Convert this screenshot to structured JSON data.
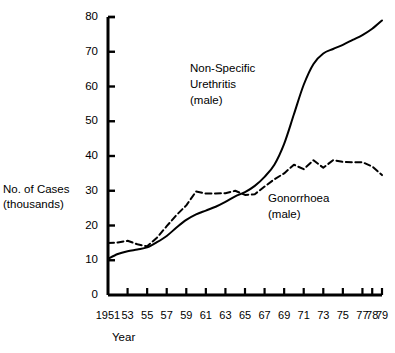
{
  "chart_data": {
    "type": "line",
    "title": "",
    "subtitle": "",
    "xlabel": "Year",
    "ylabel": "No. of Cases\n(thousands)",
    "ylabel_line1": "No. of Cases",
    "ylabel_line2": "(thousands)",
    "xlim": [
      1951,
      1979
    ],
    "ylim": [
      0,
      80
    ],
    "grid": false,
    "legend_position": "inline-annotations",
    "y_ticks": [
      0,
      10,
      20,
      30,
      40,
      50,
      60,
      70,
      80
    ],
    "y_tick_labels": [
      "0",
      "10",
      "20",
      "30",
      "40",
      "50",
      "60",
      "70",
      "80"
    ],
    "x_ticks": [
      1951,
      1953,
      1955,
      1957,
      1959,
      1961,
      1963,
      1965,
      1967,
      1969,
      1971,
      1973,
      1975,
      1977,
      1978,
      1979
    ],
    "x_tick_labels": [
      "1951",
      "53",
      "55",
      "57",
      "59",
      "61",
      "63",
      "65",
      "67",
      "69",
      "71",
      "73",
      "75",
      "77",
      "78",
      "79"
    ],
    "series": [
      {
        "name": "Non-Specific Urethritis (male)",
        "label_line1": "Non-Specific",
        "label_line2": "Urethritis",
        "label_line3": "(male)",
        "style": "solid",
        "color": "#000000",
        "x": [
          1951,
          1952,
          1953,
          1954,
          1955,
          1956,
          1957,
          1958,
          1959,
          1960,
          1961,
          1962,
          1963,
          1964,
          1965,
          1966,
          1967,
          1968,
          1969,
          1970,
          1971,
          1972,
          1973,
          1974,
          1975,
          1976,
          1977,
          1978,
          1979
        ],
        "values": [
          10.4,
          11.8,
          12.6,
          13.1,
          13.7,
          15.2,
          17.0,
          19.4,
          21.6,
          23.2,
          24.3,
          25.4,
          26.8,
          28.4,
          29.6,
          31.4,
          34.0,
          37.5,
          43.5,
          52.0,
          60.5,
          66.5,
          69.5,
          70.8,
          72.0,
          73.4,
          74.8,
          76.6,
          79.0
        ]
      },
      {
        "name": "Gonorrhoea (male)",
        "label_line1": "Gonorrhoea",
        "label_line2": "(male)",
        "style": "dashed",
        "color": "#000000",
        "x": [
          1951,
          1952,
          1953,
          1954,
          1955,
          1956,
          1957,
          1958,
          1959,
          1960,
          1961,
          1962,
          1963,
          1964,
          1965,
          1966,
          1967,
          1968,
          1969,
          1970,
          1971,
          1972,
          1973,
          1974,
          1975,
          1976,
          1977,
          1978,
          1979
        ],
        "values": [
          15.0,
          15.1,
          15.6,
          14.6,
          14.0,
          16.5,
          19.8,
          23.0,
          25.8,
          29.8,
          29.2,
          29.2,
          29.3,
          30.0,
          28.8,
          29.0,
          31.2,
          33.3,
          35.0,
          37.5,
          36.2,
          38.8,
          36.6,
          38.8,
          38.3,
          38.2,
          38.2,
          37.0,
          34.5
        ]
      }
    ],
    "annotations": [
      {
        "name": "nsu-label",
        "text": "Non-Specific Urethritis (male)"
      },
      {
        "name": "gonorrhoea-label",
        "text": "Gonorrhoea (male)"
      }
    ]
  }
}
